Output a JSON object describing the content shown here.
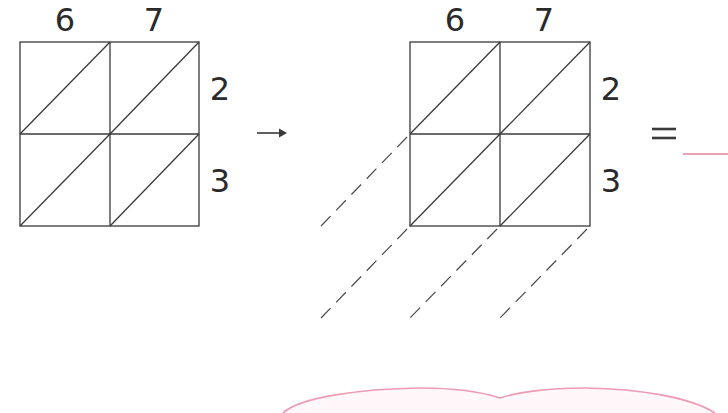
{
  "colors": {
    "ink": "#3a3a3a",
    "digit": "#2a2a2a",
    "answer_line": "#e9809e",
    "cloud_outline": "#ee9ab3"
  },
  "left_grid": {
    "top_numbers": [
      "6",
      "7"
    ],
    "side_numbers": [
      "2",
      "3"
    ]
  },
  "arrow": {
    "icon": "right-arrow-icon",
    "glyph": "→"
  },
  "right_grid": {
    "top_numbers": [
      "6",
      "7"
    ],
    "side_numbers": [
      "2",
      "3"
    ],
    "diagonal_guides": "dashed"
  },
  "equation": {
    "equals_sign": "=",
    "answer_value": ""
  },
  "answer_cloud": {
    "shape": "cloud-outline"
  }
}
